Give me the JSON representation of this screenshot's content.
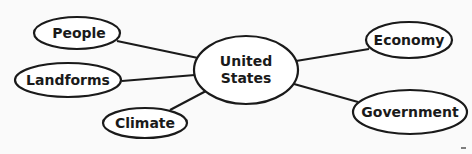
{
  "diagram": {
    "type": "concept-web",
    "center": {
      "label_line1": "United",
      "label_line2": "States"
    },
    "nodes": [
      {
        "id": "people",
        "label": "People"
      },
      {
        "id": "landforms",
        "label": "Landforms"
      },
      {
        "id": "climate",
        "label": "Climate"
      },
      {
        "id": "economy",
        "label": "Economy"
      },
      {
        "id": "government",
        "label": "Government"
      }
    ],
    "colors": {
      "stroke": "#1a1a1a",
      "fill": "#ffffff",
      "background": "#fafafa"
    }
  }
}
